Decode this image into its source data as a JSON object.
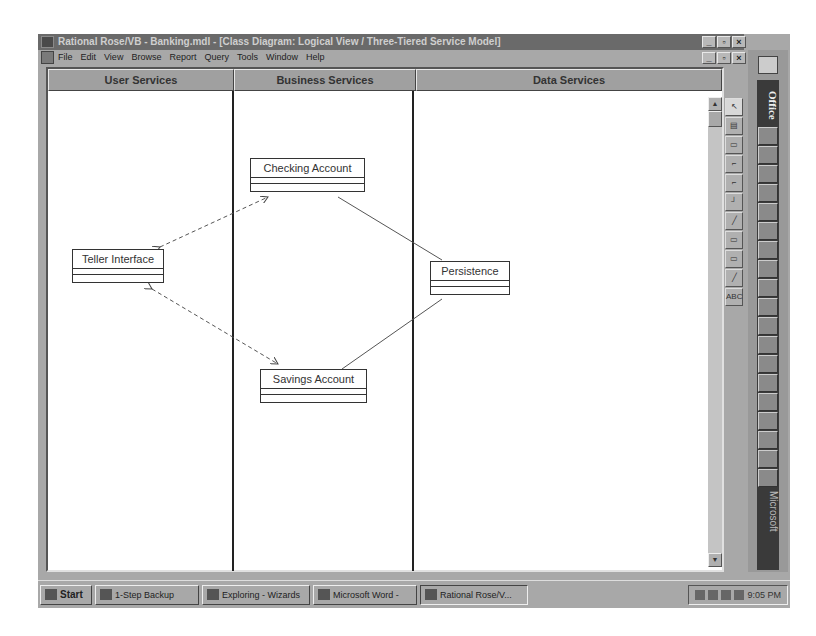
{
  "window": {
    "title": "Rational Rose/VB - Banking.mdl - [Class Diagram: Logical View / Three-Tiered Service Model]",
    "controls": [
      "_",
      "▫",
      "×"
    ]
  },
  "menu": {
    "items": [
      "File",
      "Edit",
      "View",
      "Browse",
      "Report",
      "Query",
      "Tools",
      "Window",
      "Help"
    ]
  },
  "swimlanes": [
    {
      "label": "User Services"
    },
    {
      "label": "Business Services"
    },
    {
      "label": "Data Services"
    }
  ],
  "classes": {
    "checking": {
      "name": "Checking Account"
    },
    "teller": {
      "name": "Teller Interface"
    },
    "persistence": {
      "name": "Persistence"
    },
    "savings": {
      "name": "Savings Account"
    }
  },
  "toolbox": {
    "tools": [
      "selection-arrow",
      "text-box",
      "note",
      "class",
      "interface",
      "association",
      "dependency",
      "package",
      "component",
      "anchor",
      "ABC"
    ]
  },
  "office_bar": {
    "title": "Office",
    "footer": "Microsoft"
  },
  "taskbar": {
    "start": "Start",
    "tasks": [
      {
        "label": "1-Step Backup"
      },
      {
        "label": "Exploring - Wizards"
      },
      {
        "label": "Microsoft Word -"
      },
      {
        "label": "Rational Rose/V..."
      }
    ],
    "clock": "9:05 PM"
  }
}
